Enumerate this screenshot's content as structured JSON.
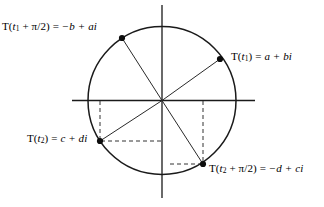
{
  "figure": {
    "type": "complex-plane-unit-circle-diagram",
    "stroke_color": "#1a1a1a",
    "dash_color": "#333333",
    "background": "#ffffff"
  },
  "geometry": {
    "center": {
      "x": 162,
      "y": 100.5
    },
    "radius": 74,
    "x_axis": {
      "x1": 72,
      "y1": 100.5,
      "x2": 255,
      "y2": 100.5
    },
    "y_axis": {
      "x1": 162,
      "y1": 5,
      "x2": 162,
      "y2": 198
    }
  },
  "points": [
    {
      "key": "t1",
      "x": 220,
      "y": 59,
      "label": "T(t₁) = a + bi",
      "label_fn": "T",
      "label_arg": "t₁",
      "label_value": "a + bi"
    },
    {
      "key": "t1_plus_pi_over_2",
      "x": 122,
      "y": 38,
      "label": "T(t₁ + π/2) = −b + ai",
      "label_fn": "T",
      "label_arg": "t₁ + π/2",
      "label_value": "−b + ai"
    },
    {
      "key": "t2",
      "x": 100,
      "y": 141,
      "label": "T(t₂) = c + di",
      "label_fn": "T",
      "label_arg": "t₂",
      "label_value": "c + di"
    },
    {
      "key": "t2_plus_pi_over_2",
      "x": 203,
      "y": 164,
      "label": "T(t₂ + π/2) = −d + ci",
      "label_fn": "T",
      "label_arg": "t₂ + π/2",
      "label_value": "−d + ci"
    }
  ],
  "labels": {
    "t1": {
      "fn": "T(",
      "arg_base": "t",
      "arg_sub": "1",
      "arg_rest": ")",
      "eq": " = ",
      "value": "a + bi"
    },
    "t1pi2": {
      "fn": "T(",
      "arg_base": "t",
      "arg_sub": "1",
      "arg_rest": " + π/2)",
      "eq": " = ",
      "value": "−b + ai"
    },
    "t2": {
      "fn": "T(",
      "arg_base": "t",
      "arg_sub": "2",
      "arg_rest": ")",
      "eq": " = ",
      "value": "c + di"
    },
    "t2pi2": {
      "fn": "T(",
      "arg_base": "t",
      "arg_sub": "2",
      "arg_rest": " + π/2)",
      "eq": " = ",
      "value": "−d + ci"
    }
  },
  "dashed_guides": [
    {
      "key": "t2-vertical",
      "x1": 100,
      "y1": 101,
      "x2": 100,
      "y2": 141
    },
    {
      "key": "t2-horizontal",
      "x1": 101,
      "y1": 141,
      "x2": 162,
      "y2": 141
    },
    {
      "key": "t2pi2-vertical",
      "x1": 203,
      "y1": 101,
      "x2": 203,
      "y2": 164
    },
    {
      "key": "t2pi2-horizontal",
      "x1": 170,
      "y1": 164,
      "x2": 202,
      "y2": 164
    }
  ]
}
